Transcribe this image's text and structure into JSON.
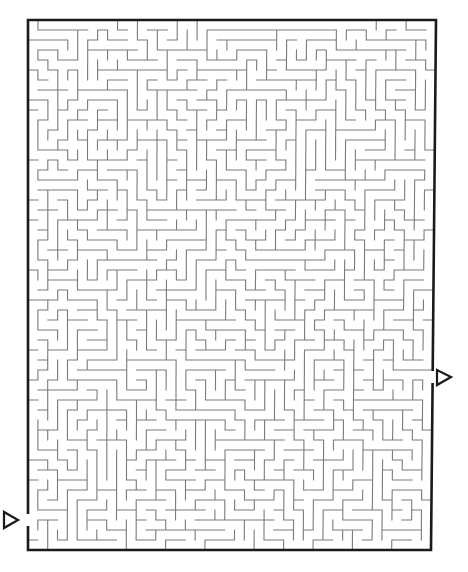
{
  "puzzle": {
    "type": "maze",
    "cols": 41,
    "rows": 53,
    "seed": 20240517,
    "border": {
      "left": 28,
      "top": 20,
      "right_top": 436,
      "right_bottom": 431,
      "bottom": 550,
      "stroke": 2.6,
      "color": "#1a1a1a"
    },
    "wall": {
      "stroke": 1.1,
      "color": "#7a7a7a"
    },
    "entrance": {
      "side": "left",
      "label": "start-arrow",
      "gap_top": 514,
      "gap_bottom": 526,
      "arrow": [
        [
          4,
          512
        ],
        [
          4,
          528
        ],
        [
          18,
          520
        ]
      ]
    },
    "exit": {
      "side": "right",
      "label": "end-arrow",
      "gap_top": 371,
      "gap_bottom": 383,
      "arrow": [
        [
          437,
          370
        ],
        [
          437,
          385
        ],
        [
          451,
          377
        ]
      ]
    }
  }
}
